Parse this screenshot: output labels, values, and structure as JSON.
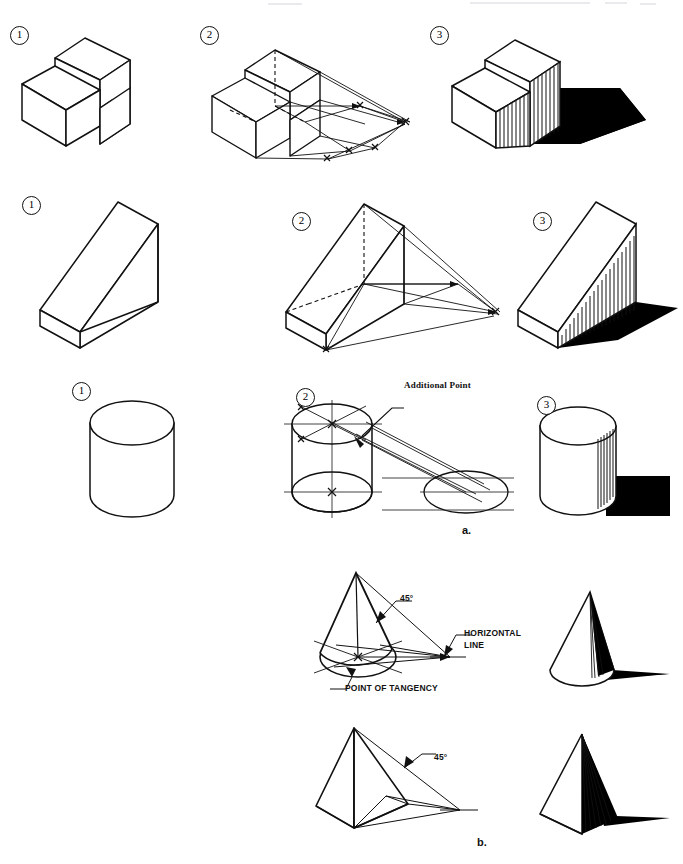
{
  "page": {
    "width": 683,
    "height": 864,
    "background": "#ffffff",
    "ink": "#111111",
    "shadow_fill": "#000000",
    "face_fill": "#ffffff"
  },
  "captions": [
    {
      "id": "a",
      "label": "a.",
      "x": 462,
      "y": 524
    },
    {
      "id": "b",
      "label": "b.",
      "x": 477,
      "y": 836
    }
  ],
  "step_labels": {
    "one": "1",
    "two": "2",
    "three": "3"
  },
  "rows": [
    {
      "id": "step-block-row",
      "name": "step-block",
      "steps": [
        {
          "n": "1",
          "badge_x": 10,
          "badge_y": 26,
          "caption": ""
        },
        {
          "n": "2",
          "badge_x": 200,
          "badge_y": 26,
          "caption": ""
        },
        {
          "n": "3",
          "badge_x": 430,
          "badge_y": 26,
          "caption": ""
        }
      ]
    },
    {
      "id": "wedge-row",
      "name": "inclined-wedge",
      "steps": [
        {
          "n": "1",
          "badge_x": 22,
          "badge_y": 196,
          "caption": ""
        },
        {
          "n": "2",
          "badge_x": 292,
          "badge_y": 212,
          "caption": ""
        },
        {
          "n": "3",
          "badge_x": 533,
          "badge_y": 212,
          "caption": ""
        }
      ]
    },
    {
      "id": "cylinder-row",
      "name": "cylinder",
      "steps": [
        {
          "n": "1",
          "badge_x": 72,
          "badge_y": 382,
          "caption": ""
        },
        {
          "n": "2",
          "badge_x": 296,
          "badge_y": 388,
          "caption": ""
        },
        {
          "n": "3",
          "badge_x": 537,
          "badge_y": 396,
          "caption": ""
        }
      ]
    }
  ],
  "annotations": {
    "additional_point": {
      "text": "Additional Point",
      "x": 396,
      "y": 380
    },
    "angle_cone": {
      "text": "45°",
      "x": 396,
      "y": 593
    },
    "angle_pyramid": {
      "text": "45°",
      "x": 424,
      "y": 756
    },
    "horizontal_line": {
      "line1": "HORIZONTAL",
      "line2": "LINE",
      "x": 452,
      "y": 632
    },
    "point_of_tangency": {
      "text": "POINT OF TANGENCY",
      "x": 343,
      "y": 676
    }
  },
  "figure_titles": {
    "group_a": "a.",
    "group_b": "b."
  }
}
